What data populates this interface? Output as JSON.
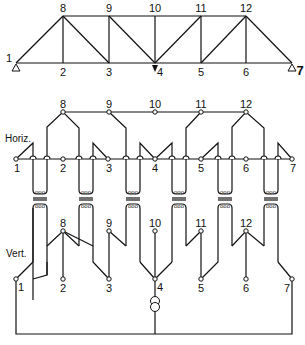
{
  "diagram": {
    "type": "truss with electrical analog network",
    "truss": {
      "top_nodes": [
        "8",
        "9",
        "10",
        "11",
        "12"
      ],
      "bottom_nodes": [
        "1",
        "2",
        "3",
        "4",
        "5",
        "6",
        "7"
      ],
      "supports": [
        "1",
        "7"
      ],
      "load_node": "4"
    },
    "network": {
      "horizontal_label": "Horiz.",
      "vertical_label": "Vert.",
      "horizontal_nodes": [
        "1",
        "2",
        "3",
        "4",
        "5",
        "6",
        "7",
        "8",
        "9",
        "10",
        "11",
        "12"
      ],
      "vertical_nodes": [
        "1",
        "2",
        "3",
        "4",
        "5",
        "6",
        "7",
        "8",
        "9",
        "10",
        "11",
        "12"
      ],
      "transformer_count": 6,
      "source_node": "4"
    }
  },
  "labels": {
    "t1": "1",
    "t2": "2",
    "t3": "3",
    "t4": "4",
    "t5": "5",
    "t6": "6",
    "t7": "7",
    "t8": "8",
    "t9": "9",
    "t10": "10",
    "t11": "11",
    "t12": "12",
    "h1": "1",
    "h2": "2",
    "h3": "3",
    "h4": "4",
    "h5": "5",
    "h6": "6",
    "h7": "7",
    "h8": "8",
    "h9": "9",
    "h10": "10",
    "h11": "11",
    "h12": "12",
    "v1": "1",
    "v2": "2",
    "v3": "3",
    "v4": "4",
    "v5": "5",
    "v6": "6",
    "v7": "7",
    "v8": "8",
    "v9": "9",
    "v10": "10",
    "v11": "11",
    "v12": "12",
    "horiz": "Horiz.",
    "vert": "Vert."
  }
}
